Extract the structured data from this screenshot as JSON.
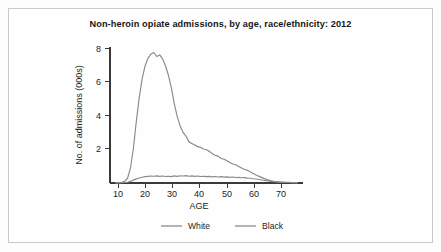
{
  "figure": {
    "title": "Non-heroin opiate admissions, by age, race/ethnicity: 2012"
  },
  "colors": {
    "white_series": "#8a8a8a",
    "black_series": "#8a8a8a",
    "axis": "#3a3a3a",
    "text": "#1d1d1d",
    "frame": "#c9c9c9",
    "page_background": "#fdfdfd"
  },
  "chart_data": {
    "type": "line",
    "title": "Non-heroin opiate admissions, by age, race/ethnicity: 2012",
    "xlabel": "AGE",
    "ylabel": "No. of admissions (000s)",
    "xlim": [
      8,
      74
    ],
    "ylim": [
      0,
      8.6
    ],
    "xticks": [
      10,
      20,
      30,
      40,
      50,
      60,
      70
    ],
    "yticks": [
      2,
      4,
      6,
      8
    ],
    "grid": false,
    "legend_position": "bottom-center",
    "x": [
      10,
      11,
      12,
      13,
      14,
      15,
      16,
      17,
      18,
      19,
      20,
      21,
      22,
      23,
      24,
      25,
      26,
      27,
      28,
      29,
      30,
      31,
      32,
      33,
      34,
      35,
      36,
      37,
      38,
      39,
      40,
      41,
      42,
      43,
      44,
      45,
      46,
      47,
      48,
      49,
      50,
      51,
      52,
      53,
      54,
      55,
      56,
      57,
      58,
      59,
      60,
      61,
      62,
      63,
      64,
      65,
      66,
      67,
      68,
      69,
      70,
      71,
      72
    ],
    "series": [
      {
        "name": "White",
        "values": [
          0.02,
          0.03,
          0.05,
          0.1,
          0.3,
          0.95,
          2.2,
          3.9,
          5.4,
          6.6,
          7.4,
          7.9,
          8.15,
          8.25,
          8.0,
          8.1,
          7.85,
          7.4,
          6.8,
          6.0,
          5.0,
          4.2,
          3.6,
          3.2,
          2.95,
          2.6,
          2.5,
          2.4,
          2.3,
          2.25,
          2.15,
          2.1,
          2.0,
          1.85,
          1.75,
          1.7,
          1.55,
          1.5,
          1.4,
          1.3,
          1.2,
          1.15,
          1.05,
          0.95,
          0.85,
          0.8,
          0.7,
          0.6,
          0.5,
          0.42,
          0.34,
          0.26,
          0.2,
          0.15,
          0.11,
          0.09,
          0.07,
          0.06,
          0.05,
          0.04,
          0.03,
          0.02,
          0.02
        ]
      },
      {
        "name": "Black",
        "values": [
          0.01,
          0.01,
          0.02,
          0.03,
          0.05,
          0.1,
          0.18,
          0.26,
          0.32,
          0.36,
          0.4,
          0.42,
          0.44,
          0.43,
          0.45,
          0.42,
          0.44,
          0.41,
          0.43,
          0.4,
          0.45,
          0.42,
          0.46,
          0.44,
          0.47,
          0.43,
          0.45,
          0.42,
          0.44,
          0.41,
          0.43,
          0.4,
          0.42,
          0.39,
          0.41,
          0.38,
          0.4,
          0.37,
          0.39,
          0.36,
          0.38,
          0.35,
          0.36,
          0.33,
          0.34,
          0.31,
          0.3,
          0.27,
          0.25,
          0.22,
          0.19,
          0.16,
          0.13,
          0.1,
          0.08,
          0.06,
          0.05,
          0.04,
          0.03,
          0.03,
          0.02,
          0.02,
          0.01
        ]
      }
    ],
    "legend": [
      "White",
      "Black"
    ]
  }
}
